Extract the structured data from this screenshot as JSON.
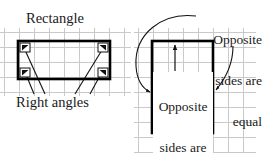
{
  "diagram": {
    "title": "Rectangle",
    "background_color": "#ffffff",
    "grid": {
      "visible": true,
      "color": "#c9c9c9",
      "spacing_px": 15
    },
    "shapes": [
      {
        "name": "rectangle",
        "kind": "rectangle",
        "stroke_color": "#000000",
        "x": 18,
        "y": 41,
        "width": 92,
        "height": 38,
        "corner_markers": 4,
        "corner_marker_label": "right-angle-marker"
      },
      {
        "name": "square",
        "kind": "square",
        "stroke_color": "#000000",
        "x": 152,
        "y": 41,
        "width": 61,
        "height": 92
      }
    ],
    "labels": {
      "rectangle_title": "Rectangle",
      "right_angles": "Right angles",
      "opposite_sides_outer": [
        "Opposite",
        "sides are",
        "equal"
      ],
      "opposite_sides_inner": [
        "Opposite",
        "sides are",
        "equal"
      ]
    },
    "annotations": {
      "leader_lines_count": 4,
      "leader_target": "Right angles",
      "curved_arrow_left": "points to left side of square",
      "curved_arrow_right": "points to right side of square",
      "inner_arrow_up": "up",
      "inner_arrow_down": "down"
    },
    "colors": {
      "ink": "#000000",
      "text": "#1a1a1a",
      "grid": "#c9c9c9"
    }
  }
}
